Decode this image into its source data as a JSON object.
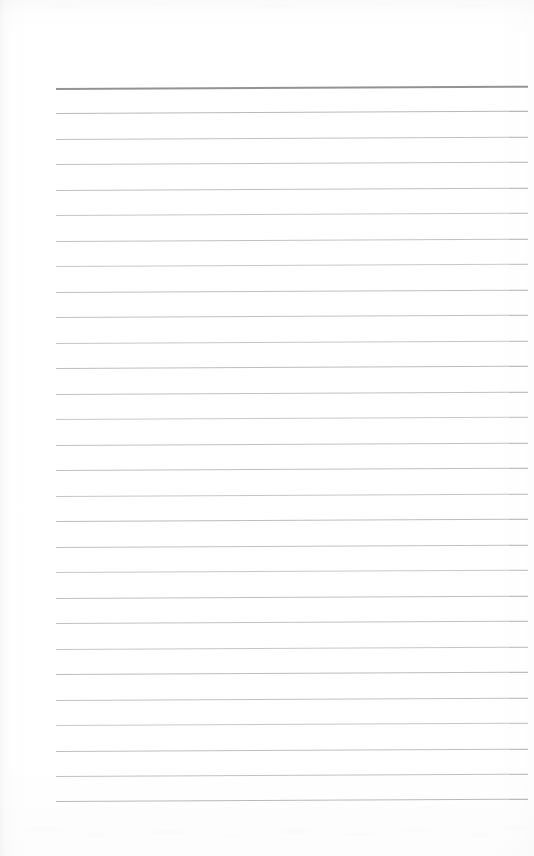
{
  "document": {
    "kind": "scanned-lined-paper",
    "title": "Blank ruled notepad page",
    "text_content": "",
    "orientation": "portrait",
    "page_width_px": 534,
    "page_height_px": 856
  },
  "colors": {
    "paper_background": "#ffffff",
    "header_rule": "#8d8d8f",
    "body_rule": "#bcbcbe",
    "body_rule_faint": "#c6c6c8",
    "scan_edge_shadow": "#ededed"
  },
  "ruling": {
    "line_count": 29,
    "first_line_y": 88,
    "line_spacing": 25.45,
    "left_x": 56,
    "right_x": 528,
    "line_length": 472,
    "tilt_degrees": -0.28,
    "header_rule_index": 0,
    "header_rule_thickness": 2,
    "body_rule_thickness": 1,
    "lines": [
      {
        "index": 0,
        "y": 88,
        "label": "header-rule",
        "color": "#8d8d8f",
        "thickness": 2,
        "opacity": 0.95
      },
      {
        "index": 1,
        "y": 113,
        "label": "rule-line-1",
        "color": "#b4b4b6",
        "thickness": 1,
        "opacity": 0.95
      },
      {
        "index": 2,
        "y": 139,
        "label": "rule-line-2",
        "color": "#bcbcbe",
        "thickness": 1,
        "opacity": 0.92
      },
      {
        "index": 3,
        "y": 164,
        "label": "rule-line-3",
        "color": "#bcbcbe",
        "thickness": 1,
        "opacity": 0.92
      },
      {
        "index": 4,
        "y": 190,
        "label": "rule-line-4",
        "color": "#bababc",
        "thickness": 1,
        "opacity": 0.93
      },
      {
        "index": 5,
        "y": 215,
        "label": "rule-line-5",
        "color": "#c0c0c2",
        "thickness": 1,
        "opacity": 0.9
      },
      {
        "index": 6,
        "y": 241,
        "label": "rule-line-6",
        "color": "#bcbcbe",
        "thickness": 1,
        "opacity": 0.92
      },
      {
        "index": 7,
        "y": 266,
        "label": "rule-line-7",
        "color": "#c2c2c4",
        "thickness": 1,
        "opacity": 0.9
      },
      {
        "index": 8,
        "y": 292,
        "label": "rule-line-8",
        "color": "#bababc",
        "thickness": 1,
        "opacity": 0.93
      },
      {
        "index": 9,
        "y": 317,
        "label": "rule-line-9",
        "color": "#bcbcbe",
        "thickness": 1,
        "opacity": 0.92
      },
      {
        "index": 10,
        "y": 343,
        "label": "rule-line-10",
        "color": "#c0c0c2",
        "thickness": 1,
        "opacity": 0.9
      },
      {
        "index": 11,
        "y": 368,
        "label": "rule-line-11",
        "color": "#b8b8ba",
        "thickness": 1,
        "opacity": 0.93
      },
      {
        "index": 12,
        "y": 394,
        "label": "rule-line-12",
        "color": "#bcbcbe",
        "thickness": 1,
        "opacity": 0.92
      },
      {
        "index": 13,
        "y": 419,
        "label": "rule-line-13",
        "color": "#c2c2c4",
        "thickness": 1,
        "opacity": 0.89
      },
      {
        "index": 14,
        "y": 445,
        "label": "rule-line-14",
        "color": "#bcbcbe",
        "thickness": 1,
        "opacity": 0.92
      },
      {
        "index": 15,
        "y": 470,
        "label": "rule-line-15",
        "color": "#bababc",
        "thickness": 1,
        "opacity": 0.93
      },
      {
        "index": 16,
        "y": 496,
        "label": "rule-line-16",
        "color": "#c0c0c2",
        "thickness": 1,
        "opacity": 0.9
      },
      {
        "index": 17,
        "y": 521,
        "label": "rule-line-17",
        "color": "#b8b8ba",
        "thickness": 1,
        "opacity": 0.93
      },
      {
        "index": 18,
        "y": 547,
        "label": "rule-line-18",
        "color": "#bcbcbe",
        "thickness": 1,
        "opacity": 0.92
      },
      {
        "index": 19,
        "y": 572,
        "label": "rule-line-19",
        "color": "#c2c2c4",
        "thickness": 1,
        "opacity": 0.89
      },
      {
        "index": 20,
        "y": 598,
        "label": "rule-line-20",
        "color": "#bababc",
        "thickness": 1,
        "opacity": 0.93
      },
      {
        "index": 21,
        "y": 623,
        "label": "rule-line-21",
        "color": "#bcbcbe",
        "thickness": 1,
        "opacity": 0.92
      },
      {
        "index": 22,
        "y": 649,
        "label": "rule-line-22",
        "color": "#c0c0c2",
        "thickness": 1,
        "opacity": 0.9
      },
      {
        "index": 23,
        "y": 674,
        "label": "rule-line-23",
        "color": "#b8b8ba",
        "thickness": 1,
        "opacity": 0.93
      },
      {
        "index": 24,
        "y": 700,
        "label": "rule-line-24",
        "color": "#bcbcbe",
        "thickness": 1,
        "opacity": 0.92
      },
      {
        "index": 25,
        "y": 725,
        "label": "rule-line-25",
        "color": "#c2c2c4",
        "thickness": 1,
        "opacity": 0.89
      },
      {
        "index": 26,
        "y": 751,
        "label": "rule-line-26",
        "color": "#bababc",
        "thickness": 1,
        "opacity": 0.93
      },
      {
        "index": 27,
        "y": 776,
        "label": "rule-line-27",
        "color": "#bcbcbe",
        "thickness": 1,
        "opacity": 0.92
      },
      {
        "index": 28,
        "y": 801,
        "label": "rule-line-28",
        "color": "#b6b6b8",
        "thickness": 1,
        "opacity": 0.94
      }
    ]
  },
  "margins": {
    "top_blank_px": 88,
    "bottom_blank_px": 55,
    "left_blank_px": 56,
    "right_blank_px": 6
  }
}
